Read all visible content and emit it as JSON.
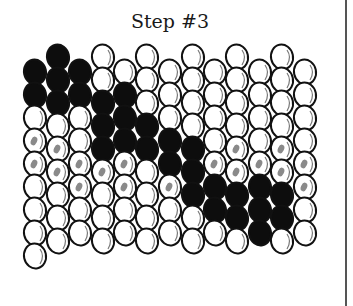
{
  "title": "Step #3",
  "colors": {
    "black_bead": "#0d0d0d",
    "white_bead": "#ffffff",
    "outline": "#111111",
    "shade_dot": "#8a8a8a"
  },
  "grid": {
    "columns": 13,
    "col_x": [
      35,
      58,
      80,
      103,
      125,
      147,
      170,
      193,
      215,
      237,
      260,
      282,
      305
    ],
    "col_top_y": [
      72,
      57,
      72,
      57,
      72,
      57,
      72,
      57,
      72,
      57,
      72,
      57,
      72
    ],
    "row_step": 23,
    "bead_rx": 11,
    "bead_ry": 12.5,
    "legend": {
      "B": "black bead",
      "W": "white bead",
      "S": "white bead with shade mark"
    },
    "columns_data": [
      [
        "B",
        "B",
        "W",
        "S",
        "S",
        "W",
        "W",
        "W",
        "W"
      ],
      [
        "B",
        "B",
        "B",
        "W",
        "S",
        "S",
        "W",
        "W",
        "W"
      ],
      [
        "B",
        "B",
        "W",
        "W",
        "S",
        "S",
        "W",
        "W"
      ],
      [
        "W",
        "W",
        "B",
        "B",
        "B",
        "S",
        "W",
        "W",
        "W"
      ],
      [
        "W",
        "B",
        "B",
        "B",
        "S",
        "S",
        "W",
        "W"
      ],
      [
        "W",
        "W",
        "W",
        "B",
        "B",
        "W",
        "W",
        "W",
        "W"
      ],
      [
        "W",
        "W",
        "W",
        "B",
        "B",
        "S",
        "W",
        "W"
      ],
      [
        "W",
        "W",
        "W",
        "W",
        "B",
        "B",
        "B",
        "W",
        "W"
      ],
      [
        "W",
        "W",
        "W",
        "W",
        "S",
        "B",
        "B",
        "W"
      ],
      [
        "W",
        "W",
        "W",
        "W",
        "S",
        "S",
        "B",
        "B",
        "W"
      ],
      [
        "W",
        "W",
        "W",
        "W",
        "S",
        "B",
        "B",
        "B"
      ],
      [
        "W",
        "W",
        "W",
        "W",
        "S",
        "S",
        "B",
        "B",
        "W"
      ],
      [
        "W",
        "W",
        "W",
        "W",
        "S",
        "S",
        "W",
        "W"
      ]
    ]
  }
}
